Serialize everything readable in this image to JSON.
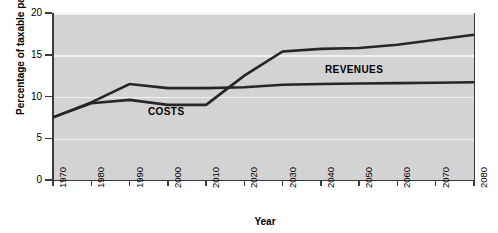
{
  "chart_data": {
    "type": "line",
    "title": "",
    "xlabel": "Year",
    "ylabel": "Percentage of taxable payroll",
    "xlim": [
      1970,
      2080
    ],
    "ylim": [
      0,
      20
    ],
    "yticks": [
      0,
      5,
      10,
      15,
      20
    ],
    "ytick_labels": [
      "0",
      "5",
      "10",
      "15",
      "20"
    ],
    "xticks": [
      1970,
      1980,
      1990,
      2000,
      2010,
      2020,
      2030,
      2040,
      2050,
      2060,
      2070,
      2080
    ],
    "xtick_labels": [
      "1970",
      "1980",
      "1990",
      "2000",
      "2010",
      "2020",
      "2030",
      "2040",
      "2050",
      "2060",
      "2070",
      "2080"
    ],
    "grid": true,
    "grid_orientation": "horizontal",
    "legend_position": "inline-annotations",
    "plot_background": "#d3d3d3",
    "gridline_color": "#f2f2f2",
    "line_color": "#262626",
    "x": [
      1970,
      1980,
      1990,
      2000,
      2010,
      2020,
      2030,
      2040,
      2050,
      2060,
      2070,
      2080
    ],
    "series": [
      {
        "name": "REVENUES",
        "label": "REVENUES",
        "values": [
          7.5,
          9.3,
          11.5,
          11.0,
          11.0,
          11.1,
          11.4,
          11.5,
          11.55,
          11.6,
          11.65,
          11.7
        ]
      },
      {
        "name": "COSTS",
        "label": "COSTS",
        "values": [
          7.5,
          9.2,
          9.6,
          9.0,
          9.0,
          12.5,
          15.4,
          15.7,
          15.8,
          16.2,
          16.8,
          17.4
        ]
      }
    ],
    "annotations": [
      {
        "text": "COSTS",
        "x": 2000,
        "y": 7.8
      },
      {
        "text": "REVENUES",
        "x": 2045,
        "y": 13.2
      }
    ]
  }
}
